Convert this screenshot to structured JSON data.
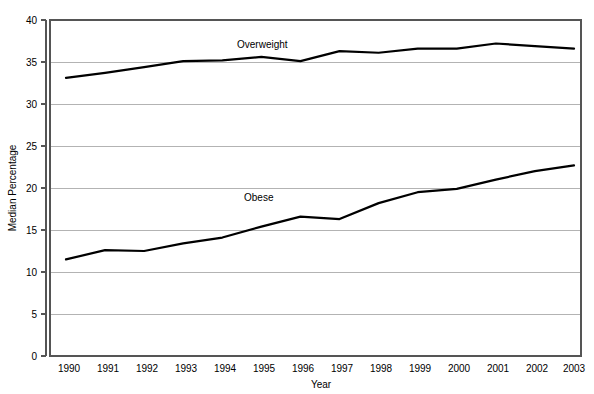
{
  "chart_data": {
    "type": "line",
    "title": "",
    "xlabel": "Year",
    "ylabel": "Median Percentage",
    "categories": [
      "1990",
      "1991",
      "1992",
      "1993",
      "1994",
      "1995",
      "1996",
      "1997",
      "1998",
      "1999",
      "2000",
      "2001",
      "2002",
      "2003"
    ],
    "x": [
      1990,
      1991,
      1992,
      1993,
      1994,
      1995,
      1996,
      1997,
      1998,
      1999,
      2000,
      2001,
      2002,
      2003
    ],
    "series": [
      {
        "name": "Overweight",
        "values": [
          33.1,
          33.7,
          34.4,
          35.1,
          35.2,
          35.6,
          35.1,
          36.3,
          36.1,
          36.6,
          36.6,
          37.2,
          36.9,
          36.6
        ],
        "label_text": "Overweight"
      },
      {
        "name": "Obese",
        "values": [
          11.5,
          12.6,
          12.5,
          13.4,
          14.1,
          15.4,
          16.6,
          16.3,
          18.2,
          19.5,
          19.9,
          21.0,
          22.0,
          22.7
        ],
        "label_text": "Obese"
      }
    ],
    "ylim": [
      0,
      40
    ],
    "yticks": [
      0,
      5,
      10,
      15,
      20,
      25,
      30,
      35,
      40
    ],
    "ytick_labels": [
      "0",
      "5",
      "10",
      "15",
      "20",
      "25",
      "30",
      "35",
      "40"
    ],
    "grid": true,
    "grid_axis": "y",
    "legend": "inline-series-labels",
    "line_color": "#000000",
    "grid_color": "#b3b3b3",
    "frame_color": "#555555",
    "background_color": "#ffffff"
  },
  "axis": {
    "y_title": "Median Percentage",
    "x_title": "Year"
  },
  "series_labels": {
    "overweight": "Overweight",
    "obese": "Obese"
  },
  "ytick_labels": {
    "t0": "0",
    "t1": "5",
    "t2": "10",
    "t3": "15",
    "t4": "20",
    "t5": "25",
    "t6": "30",
    "t7": "35",
    "t8": "40"
  },
  "xtick_labels": {
    "x0": "1990",
    "x1": "1991",
    "x2": "1992",
    "x3": "1993",
    "x4": "1994",
    "x5": "1995",
    "x6": "1996",
    "x7": "1997",
    "x8": "1998",
    "x9": "1999",
    "x10": "2000",
    "x11": "2001",
    "x12": "2002",
    "x13": "2003"
  }
}
